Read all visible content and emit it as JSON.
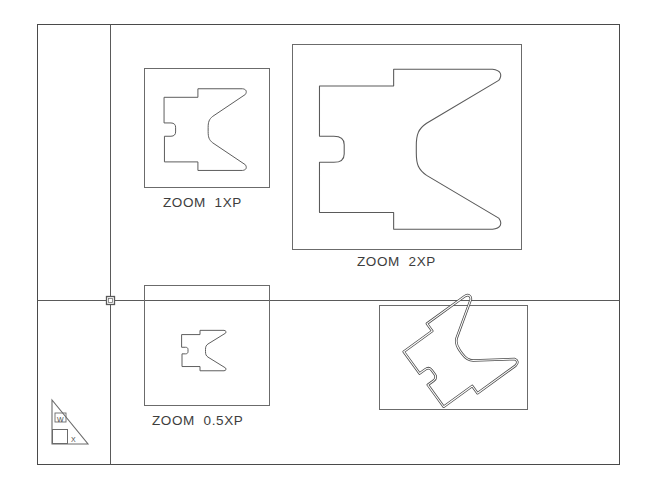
{
  "drawing": {
    "title": "AutoCAD Paper Space Layout with Zoom XP Viewports",
    "canvas_width": 650,
    "canvas_height": 501,
    "background_color": "#ffffff",
    "line_color": "#4a4a4a",
    "heavy_line_color": "#3a3a3a"
  },
  "sheet": {
    "border": {
      "x": 37,
      "y": 24,
      "width": 583,
      "height": 441
    },
    "vertical_divider_x": 110,
    "horizontal_construction_line_y": 300,
    "origin_marker": {
      "x": 110,
      "y": 300,
      "size": 8
    }
  },
  "ucs_icon": {
    "name": "world-ucs-icon",
    "x_label": "X",
    "y_label": "W",
    "box": {
      "x": 45,
      "y": 396,
      "width": 50,
      "height": 50
    }
  },
  "viewports": [
    {
      "id": "vp-1xp",
      "label": "ZOOM  1XP",
      "scale": "1XP",
      "frame": {
        "x": 144,
        "y": 68,
        "width": 126,
        "height": 120
      },
      "content": "profile-section-outline",
      "lineweight": "thin"
    },
    {
      "id": "vp-2xp",
      "label": "ZOOM  2XP",
      "scale": "2XP",
      "frame": {
        "x": 292,
        "y": 44,
        "width": 230,
        "height": 206
      },
      "content": "profile-section-outline",
      "lineweight": "thin"
    },
    {
      "id": "vp-05xp",
      "label": "ZOOM  0.5XP",
      "scale": "0.5XP",
      "frame": {
        "x": 144,
        "y": 285,
        "width": 126,
        "height": 121
      },
      "content": "profile-section-outline",
      "lineweight": "thin"
    },
    {
      "id": "vp-rotated",
      "label": "",
      "scale": "",
      "frame": {
        "x": 379,
        "y": 305,
        "width": 149,
        "height": 105
      },
      "content": "profile-section-outline-rotated",
      "lineweight": "heavy"
    }
  ],
  "labels": {
    "vp1": "ZOOM  1XP",
    "vp2": "ZOOM  2XP",
    "vp3": "ZOOM  0.5XP"
  }
}
